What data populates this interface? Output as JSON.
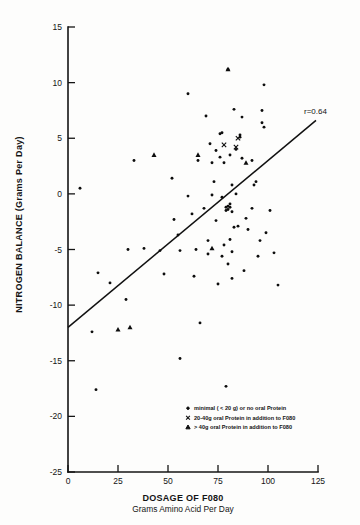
{
  "chart_data": {
    "type": "scatter",
    "title": "",
    "xlabel": "DOSAGE OF F080",
    "xlabel_sub": "Grams Amino Acid Per Day",
    "ylabel": "NITROGEN BALANCE (Grams Per Day)",
    "xlim": [
      0,
      125
    ],
    "ylim": [
      -25,
      15
    ],
    "xticks": [
      0,
      25,
      50,
      75,
      100,
      125
    ],
    "xtick_labels": [
      "0",
      "25",
      "50",
      "75",
      "100",
      "125"
    ],
    "yticks": [
      15,
      10,
      5,
      0,
      -5,
      -10,
      -15,
      -20,
      -25
    ],
    "ytick_labels": [
      "15",
      "10",
      "5",
      "0",
      "-5",
      "-10",
      "-15",
      "-20",
      "-25"
    ],
    "grid": false,
    "legend_position": "bottom-right",
    "annotations": [
      {
        "text": "r=0.64",
        "x": 118,
        "y": 7.2
      }
    ],
    "regression_line": {
      "label": "r=0.64",
      "correlation": 0.64,
      "x_start": 0,
      "y_start": -12.0,
      "x_end": 124,
      "y_end": 6.6
    },
    "series": [
      {
        "name": "minimal ( < 20 g) or no oral Protein",
        "marker": "dot",
        "points": [
          [
            6,
            0.5
          ],
          [
            33,
            3.0
          ],
          [
            38,
            -4.9
          ],
          [
            52,
            1.4
          ],
          [
            53,
            -2.3
          ],
          [
            55,
            -3.7
          ],
          [
            56,
            -5.1
          ],
          [
            60,
            9.0
          ],
          [
            60,
            -0.2
          ],
          [
            62,
            -1.8
          ],
          [
            63,
            -7.4
          ],
          [
            64,
            -5.0
          ],
          [
            65,
            3.0
          ],
          [
            66,
            -11.6
          ],
          [
            68,
            -1.3
          ],
          [
            69,
            7.0
          ],
          [
            70,
            -4.2
          ],
          [
            70,
            -5.4
          ],
          [
            71,
            4.5
          ],
          [
            72,
            2.8
          ],
          [
            72,
            -0.1
          ],
          [
            73,
            1.1
          ],
          [
            74,
            3.9
          ],
          [
            74,
            -2.4
          ],
          [
            75,
            -8.1
          ],
          [
            76,
            5.4
          ],
          [
            76,
            3.3
          ],
          [
            77,
            5.5
          ],
          [
            77,
            -0.3
          ],
          [
            77,
            -5.6
          ],
          [
            78,
            2.8
          ],
          [
            78,
            -4.6
          ],
          [
            79,
            -1.2
          ],
          [
            79,
            -1.5
          ],
          [
            79,
            -17.3
          ],
          [
            80,
            11.2
          ],
          [
            80,
            -1.1
          ],
          [
            80,
            -1.4
          ],
          [
            80,
            -6.3
          ],
          [
            81,
            3.5
          ],
          [
            81,
            -0.9
          ],
          [
            81,
            -1.2
          ],
          [
            81,
            -4.1
          ],
          [
            82,
            0.8
          ],
          [
            82,
            -1.6
          ],
          [
            82,
            -5.2
          ],
          [
            82,
            -7.6
          ],
          [
            83,
            7.6
          ],
          [
            83,
            -3.0
          ],
          [
            84,
            4.0
          ],
          [
            84,
            0.0
          ],
          [
            85,
            -2.9
          ],
          [
            86,
            5.1
          ],
          [
            86,
            5.3
          ],
          [
            87,
            6.9
          ],
          [
            87,
            3.2
          ],
          [
            88,
            -6.9
          ],
          [
            89,
            -2.2
          ],
          [
            90,
            -3.2
          ],
          [
            92,
            3.0
          ],
          [
            92,
            -1.3
          ],
          [
            93,
            0.8
          ],
          [
            94,
            1.1
          ],
          [
            95,
            -5.6
          ],
          [
            96,
            -4.2
          ],
          [
            97,
            7.5
          ],
          [
            97,
            6.4
          ],
          [
            98,
            9.8
          ],
          [
            98,
            6.0
          ],
          [
            99,
            -3.5
          ],
          [
            101,
            -1.5
          ],
          [
            103,
            -5.3
          ],
          [
            105,
            -8.2
          ],
          [
            56,
            -14.8
          ],
          [
            29,
            -9.5
          ],
          [
            30,
            -5.0
          ],
          [
            46,
            -5.1
          ],
          [
            48,
            -7.2
          ],
          [
            21,
            -8.0
          ],
          [
            15,
            -7.1
          ],
          [
            12,
            -12.4
          ],
          [
            14,
            -17.6
          ]
        ]
      },
      {
        "name": "20-40g oral Protein in addition to F080",
        "marker": "cross",
        "points": [
          [
            85,
            5.0
          ],
          [
            78,
            4.4
          ],
          [
            84,
            4.2
          ]
        ]
      },
      {
        "name": "> 40g oral Protein in addition to F080",
        "marker": "triangle",
        "points": [
          [
            43,
            3.5
          ],
          [
            65,
            3.5
          ],
          [
            80,
            11.2
          ],
          [
            89,
            2.8
          ],
          [
            72,
            -4.9
          ],
          [
            31,
            -12.0
          ],
          [
            25,
            -12.2
          ]
        ]
      }
    ]
  },
  "legend": {
    "items": [
      {
        "marker": "dot",
        "label": "minimal ( < 20 g) or no oral Protein"
      },
      {
        "marker": "cross",
        "label": "20-40g oral Protein in addition to F080"
      },
      {
        "marker": "triangle",
        "label": "> 40g oral Protein in addition to F080"
      }
    ]
  }
}
